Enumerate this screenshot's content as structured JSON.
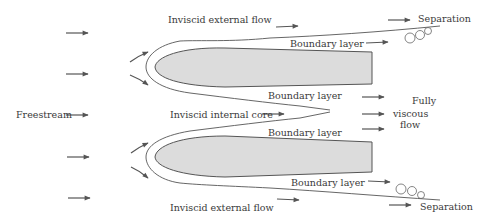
{
  "labels": {
    "inviscid_external_top": "Inviscid external flow",
    "inviscid_external_bottom": "Inviscid external flow",
    "boundary_layer_1": "Boundary layer",
    "boundary_layer_2": "Boundary layer",
    "boundary_layer_3": "Boundary layer",
    "boundary_layer_4": "Boundary layer",
    "inviscid_internal_core": "Inviscid internal core",
    "freestream": "Freestream",
    "fully_viscous_1": "Fully",
    "fully_viscous_2": "viscous",
    "fully_viscous_3": "flow",
    "separation_top": "Separation",
    "separation_bottom": "Separation"
  },
  "colors": {
    "body_fill": "#dcdcdc",
    "line": "#555555",
    "text": "#3a3a3a"
  }
}
